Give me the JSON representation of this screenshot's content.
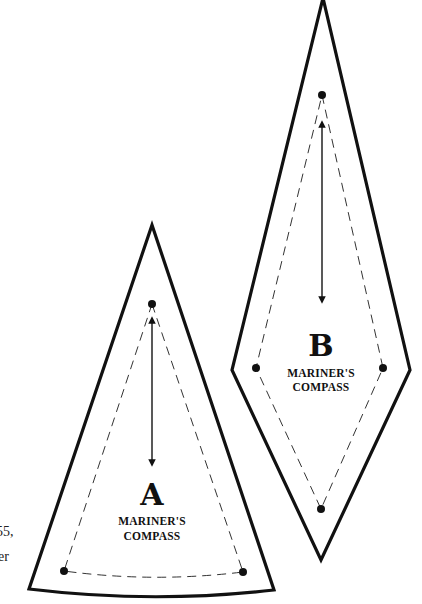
{
  "diagram": {
    "type": "quilt-pattern-templates",
    "colors": {
      "line": "#111111",
      "background": "#ffffff"
    },
    "pieces": [
      {
        "id": "A",
        "letter": "A",
        "name_line1": "MARINER'S",
        "name_line2": "COMPASS",
        "shape": "curved-base wedge",
        "has_grain_arrow": true,
        "has_seam_line": true
      },
      {
        "id": "B",
        "letter": "B",
        "name_line1": "MARINER'S",
        "name_line2": "COMPASS",
        "shape": "elongated diamond",
        "has_grain_arrow": true,
        "has_seam_line": true
      }
    ],
    "cropped_side_text": [
      "55,",
      "er"
    ]
  }
}
